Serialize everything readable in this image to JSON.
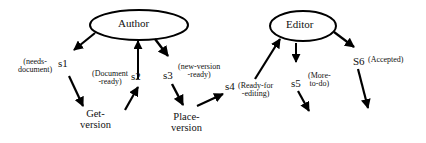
{
  "diagram": {
    "type": "workflow-state-diagram",
    "roles": [
      {
        "id": "author",
        "label": "Author"
      },
      {
        "id": "editor",
        "label": "Editor"
      }
    ],
    "tasks": [
      {
        "id": "get-version",
        "line1": "Get-",
        "line2": "version"
      },
      {
        "id": "place-version",
        "line1": "Place-",
        "line2": "version"
      }
    ],
    "states": [
      {
        "id": "s1",
        "label": "s1",
        "desc1": "(needs-",
        "desc2": "document)"
      },
      {
        "id": "s2",
        "label": "s2",
        "desc1": "(Document",
        "desc2": "-ready)"
      },
      {
        "id": "s3",
        "label": "s3",
        "desc1": "(new-version",
        "desc2": "-ready)"
      },
      {
        "id": "s4",
        "label": "s4",
        "desc1": "(Ready-for",
        "desc2": "-editing)"
      },
      {
        "id": "s5",
        "label": "s5",
        "desc1": "(More-",
        "desc2": "to-do)"
      },
      {
        "id": "s6",
        "label": "S6",
        "desc1": "(Accepted)"
      }
    ],
    "edges": [
      {
        "from": "author",
        "to": "s1"
      },
      {
        "from": "s1",
        "to": "get-version"
      },
      {
        "from": "get-version",
        "to": "s2"
      },
      {
        "from": "s2",
        "to": "author"
      },
      {
        "from": "author",
        "to": "s3"
      },
      {
        "from": "s3",
        "to": "place-version"
      },
      {
        "from": "place-version",
        "to": "s4"
      },
      {
        "from": "s4",
        "to": "editor"
      },
      {
        "from": "editor",
        "to": "s5"
      },
      {
        "from": "s5",
        "to": "(continues)"
      },
      {
        "from": "editor",
        "to": "s6"
      },
      {
        "from": "s6",
        "to": "(continues)"
      }
    ],
    "colors": {
      "stroke": "#000000",
      "background": "#ffffff"
    }
  }
}
